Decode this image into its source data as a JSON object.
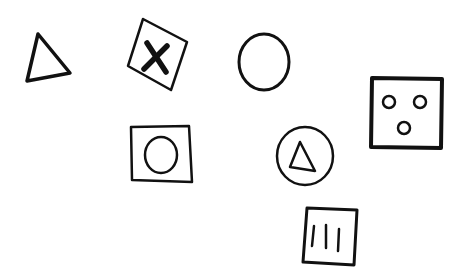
{
  "canvas": {
    "width": 464,
    "height": 280,
    "background": "#ffffff",
    "stroke": "#111111"
  },
  "symbols": [
    {
      "name": "triangle",
      "description": "Outlined triangle"
    },
    {
      "name": "square-with-x",
      "description": "Tilted square containing a bold X"
    },
    {
      "name": "circle",
      "description": "Outlined circle"
    },
    {
      "name": "square-with-three-dots",
      "description": "Square containing three small circles (face-like)"
    },
    {
      "name": "square-with-circle",
      "description": "Square containing a circle"
    },
    {
      "name": "circle-with-triangle",
      "description": "Circle containing a triangle"
    },
    {
      "name": "square-with-three-bars",
      "description": "Square containing three vertical bars"
    }
  ]
}
